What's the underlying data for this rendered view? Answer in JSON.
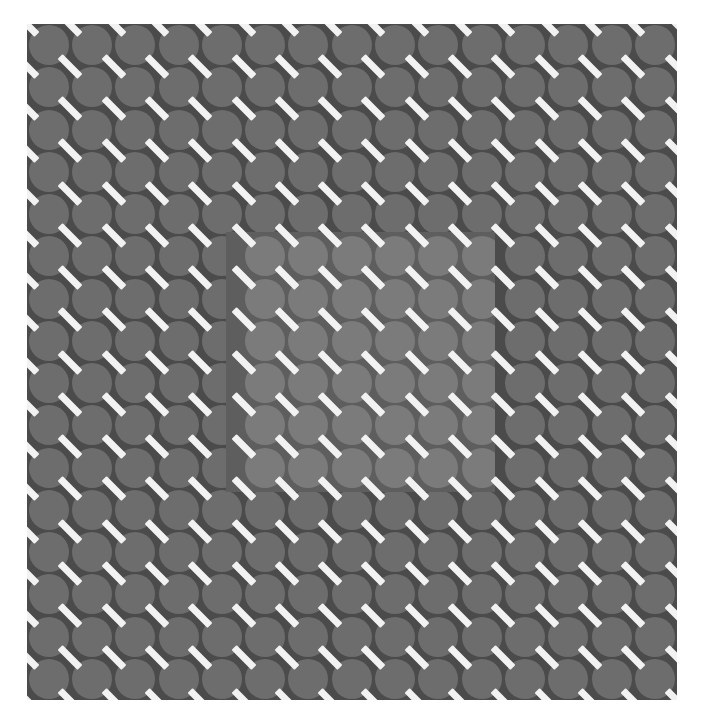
{
  "figure": {
    "type": "static-image",
    "canvas": {
      "width": 701,
      "height": 723,
      "background": "#ffffff"
    },
    "plate": {
      "name": "outer-field",
      "x": 27,
      "y": 24,
      "width": 650,
      "height": 676,
      "background_color": "#4b4b4b",
      "disc_color": "#6d6d6d"
    },
    "inset": {
      "name": "inner-field",
      "x": 226,
      "y": 232,
      "width": 269,
      "height": 260,
      "background_color": "#5e5e5e",
      "disc_color": "#7b7b7b"
    },
    "lattice": {
      "spacing_x": 43.3,
      "spacing_y": 42.25,
      "columns": 15,
      "rows": 16,
      "disc_diameter": 40,
      "disc_shape": "circle"
    },
    "dashes": {
      "color": "#f2f2f2",
      "length": 28,
      "thickness": 7,
      "angle_degrees": 45,
      "orientation_label": "backslash",
      "placement": "lattice-interstices"
    },
    "colors": {
      "outer_background": "#4b4b4b",
      "outer_disc": "#6d6d6d",
      "inner_background": "#5e5e5e",
      "inner_disc": "#7b7b7b",
      "dash": "#f2f2f2",
      "page": "#ffffff"
    }
  }
}
